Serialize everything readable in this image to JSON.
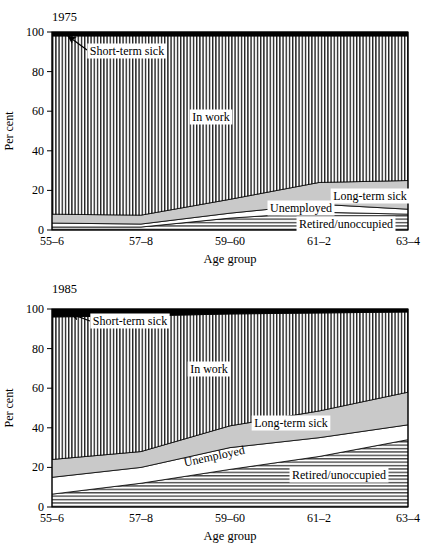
{
  "colors": {
    "background": "#ffffff",
    "text": "#000000",
    "light_gray": "#c9c9c9",
    "hatch_line": "#000000",
    "black_band": "#000000",
    "white_band": "#ffffff"
  },
  "chart_data": [
    {
      "type": "area",
      "stacked": true,
      "title": "1975",
      "xlabel": "Age group",
      "ylabel": "Per cent",
      "ylim": [
        0,
        100
      ],
      "yticks": [
        0,
        20,
        40,
        60,
        80,
        100
      ],
      "grid": false,
      "legend_position": "inline-labels",
      "categories": [
        "55–6",
        "57–8",
        "59–60",
        "61–2",
        "63–4"
      ],
      "series": [
        {
          "name": "Retired/unoccupied",
          "style": "horizontal-hatch",
          "values": [
            1.5,
            1.5,
            6,
            9,
            8
          ]
        },
        {
          "name": "Unemployed",
          "style": "white",
          "values": [
            2,
            1.5,
            2.5,
            4,
            2.5
          ]
        },
        {
          "name": "Long-term sick",
          "style": "light-gray",
          "values": [
            4.5,
            4.5,
            7,
            11,
            14.5
          ]
        },
        {
          "name": "In work",
          "style": "vertical-hatch",
          "values": [
            90,
            90.5,
            82.5,
            74,
            73
          ]
        },
        {
          "name": "Short-term sick",
          "style": "black",
          "values": [
            2,
            2,
            2,
            2,
            2
          ]
        }
      ]
    },
    {
      "type": "area",
      "stacked": true,
      "title": "1985",
      "xlabel": "Age group",
      "ylabel": "Per cent",
      "ylim": [
        0,
        100
      ],
      "yticks": [
        0,
        20,
        40,
        60,
        80,
        100
      ],
      "grid": false,
      "legend_position": "inline-labels",
      "categories": [
        "55–6",
        "57–8",
        "59–60",
        "61–2",
        "63–4"
      ],
      "series": [
        {
          "name": "Retired/unoccupied",
          "style": "horizontal-hatch",
          "values": [
            6.5,
            12,
            19,
            25.5,
            34
          ]
        },
        {
          "name": "Unemployed",
          "style": "white",
          "values": [
            8.5,
            8,
            11,
            9.5,
            7.5
          ]
        },
        {
          "name": "Long-term sick",
          "style": "light-gray",
          "values": [
            9,
            8,
            11,
            13.5,
            16.5
          ]
        },
        {
          "name": "In work",
          "style": "vertical-hatch",
          "values": [
            72,
            68.5,
            56.5,
            49.5,
            40.5
          ]
        },
        {
          "name": "Short-term sick",
          "style": "black",
          "values": [
            4,
            3.5,
            2.5,
            2,
            1.5
          ]
        }
      ]
    }
  ]
}
